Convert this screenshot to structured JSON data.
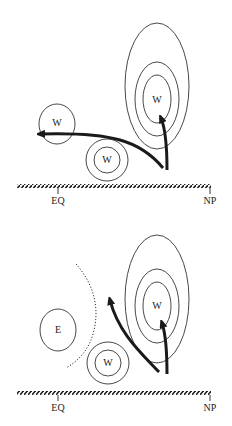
{
  "panels": [
    {
      "id": "top",
      "axis": {
        "left_label": "EQ",
        "right_label": "NP"
      },
      "systems": [
        {
          "type": "warm",
          "label": "W",
          "role": "high-latitude warm center with nested contours"
        },
        {
          "type": "warm",
          "label": "W",
          "role": "western warm center"
        },
        {
          "type": "warm",
          "label": "W",
          "role": "low-latitude warm center with double contour"
        }
      ],
      "arrows": [
        {
          "description": "northward arrow into high-latitude W"
        },
        {
          "description": "curved westward arrow toward western W"
        }
      ]
    },
    {
      "id": "bottom",
      "axis": {
        "left_label": "EQ",
        "right_label": "NP"
      },
      "systems": [
        {
          "type": "warm",
          "label": "W",
          "role": "high-latitude warm center with nested contours"
        },
        {
          "type": "east",
          "label": "E",
          "role": "western E region"
        },
        {
          "type": "warm",
          "label": "W",
          "role": "low-latitude warm center with double contour"
        }
      ],
      "arrows": [
        {
          "description": "northward arrow into high-latitude W"
        },
        {
          "description": "curved north-westward arrow"
        }
      ],
      "boundary": {
        "style": "dotted arc",
        "description": "dotted boundary separating E region"
      }
    }
  ],
  "colors": {
    "ink": "#222222",
    "background": "#ffffff"
  }
}
